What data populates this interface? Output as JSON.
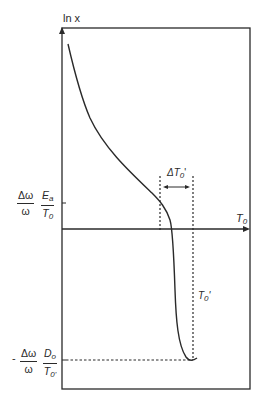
{
  "diagram": {
    "y_axis_label": "ln x",
    "x_axis_label": "T",
    "x_axis_label_sub": "0",
    "upper_level": {
      "prefix": "",
      "frac1_num": "Δω",
      "frac1_den": "ω",
      "frac2_num": "E",
      "frac2_num_sub": "a",
      "frac2_den": "T",
      "frac2_den_sub": "0"
    },
    "lower_level": {
      "prefix": "-",
      "frac1_num": "Δω",
      "frac1_den": "ω",
      "frac2_num": "D",
      "frac2_num_sub": "o",
      "frac2_den": "T",
      "frac2_den_sub": "0'"
    },
    "delta_label": "ΔT",
    "delta_label_sub": "0",
    "delta_label_prime": "'",
    "t0_prime_label": "T",
    "t0_prime_label_sub": "0",
    "t0_prime_label_prime": "'",
    "colors": {
      "line": "#2a2a2a",
      "background": "#ffffff"
    }
  }
}
